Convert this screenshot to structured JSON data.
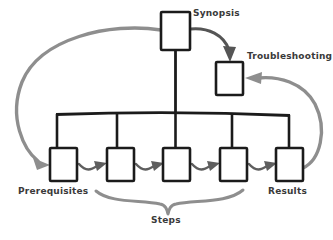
{
  "diagram": {
    "type": "flow-diagram",
    "canvas": {
      "width": 333,
      "height": 240,
      "background": "#ffffff"
    },
    "colors": {
      "box_stroke": "#1b1b1b",
      "box_fill": "#ffffff",
      "bus_stroke": "#1b1b1b",
      "small_arrow": "#5e5e5e",
      "sweep_arrow": "#8e8e8e",
      "top_arrow": "#555555",
      "brace": "#8e8e8e",
      "label_text": "#3a3a3a"
    },
    "labels": {
      "synopsis": "Synopsis",
      "troubleshooting": "Troubleshooting",
      "prerequisites": "Prerequisites",
      "results": "Results",
      "steps": "Steps"
    },
    "nodes": [
      {
        "id": "synopsis",
        "label": "Synopsis",
        "x": 161,
        "y": 12,
        "w": 29,
        "h": 38
      },
      {
        "id": "troubleshooting",
        "label": "Troubleshooting",
        "x": 216,
        "y": 62,
        "w": 27,
        "h": 33
      },
      {
        "id": "step-1",
        "label": "Prerequisites",
        "x": 50,
        "y": 148,
        "w": 27,
        "h": 33
      },
      {
        "id": "step-2",
        "label": "",
        "x": 107,
        "y": 148,
        "w": 27,
        "h": 33
      },
      {
        "id": "step-3",
        "label": "",
        "x": 163,
        "y": 148,
        "w": 27,
        "h": 33
      },
      {
        "id": "step-4",
        "label": "",
        "x": 220,
        "y": 148,
        "w": 27,
        "h": 33
      },
      {
        "id": "step-5",
        "label": "Results",
        "x": 276,
        "y": 148,
        "w": 27,
        "h": 33
      }
    ],
    "connections": [
      {
        "from": "synopsis",
        "to": "bus",
        "style": "straight-dark"
      },
      {
        "from": "bus",
        "to": "step-1",
        "style": "drop-dark"
      },
      {
        "from": "bus",
        "to": "step-2",
        "style": "drop-dark"
      },
      {
        "from": "bus",
        "to": "step-3",
        "style": "drop-dark"
      },
      {
        "from": "bus",
        "to": "step-4",
        "style": "drop-dark"
      },
      {
        "from": "bus",
        "to": "step-5",
        "style": "drop-dark"
      },
      {
        "from": "synopsis",
        "to": "troubleshooting",
        "style": "arc-dark"
      },
      {
        "from": "synopsis",
        "to": "step-1",
        "style": "sweep-gray-left"
      },
      {
        "from": "step-5",
        "to": "troubleshooting",
        "style": "sweep-gray-right"
      },
      {
        "from": "step-1",
        "to": "step-2",
        "style": "s-arrow"
      },
      {
        "from": "step-2",
        "to": "step-3",
        "style": "s-arrow"
      },
      {
        "from": "step-3",
        "to": "step-4",
        "style": "s-arrow"
      },
      {
        "from": "step-4",
        "to": "step-5",
        "style": "s-arrow"
      }
    ],
    "brace": {
      "label": "Steps",
      "spans": [
        "step-2",
        "step-3",
        "step-4"
      ],
      "left_x": 95,
      "right_x": 243,
      "center_x": 168
    }
  }
}
